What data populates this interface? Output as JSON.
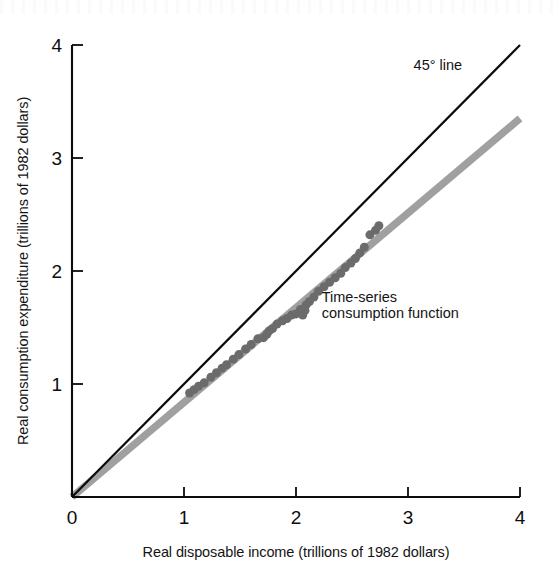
{
  "chart_data": {
    "type": "scatter",
    "title": "",
    "xlabel": "Real disposable income (trillions of 1982 dollars)",
    "ylabel": "Real consumption expenditure (trillions of 1982 dollars)",
    "xlim": [
      0,
      4
    ],
    "ylim": [
      0,
      4
    ],
    "xticks": [
      0,
      1,
      2,
      3,
      4
    ],
    "yticks": [
      0,
      1,
      2,
      3,
      4
    ],
    "xtick_labels": [
      "0",
      "1",
      "2",
      "3",
      "4"
    ],
    "ytick_labels": [
      "0",
      "1",
      "2",
      "3",
      "4"
    ],
    "grid": false,
    "legend": "none",
    "annotations": [
      {
        "text": "45° line",
        "x": 3.05,
        "y": 3.78
      },
      {
        "text": "Time-series",
        "x": 2.23,
        "y": 1.73
      },
      {
        "text": "consumption function",
        "x": 2.23,
        "y": 1.58
      }
    ],
    "series": [
      {
        "name": "45° line",
        "type": "line",
        "color": "#0b0b0b",
        "width": 2.2,
        "points": [
          [
            0,
            0
          ],
          [
            4,
            4
          ]
        ]
      },
      {
        "name": "Time-series consumption function",
        "type": "line",
        "color": "#a0a0a0",
        "width": 7.5,
        "slope": 0.838,
        "intercept": 0,
        "points": [
          [
            0,
            0
          ],
          [
            4,
            3.35
          ]
        ]
      },
      {
        "name": "Observations",
        "type": "scatter",
        "color": "#6b6b6b",
        "marker_size": 9,
        "x": [
          1.05,
          1.09,
          1.13,
          1.18,
          1.24,
          1.29,
          1.34,
          1.38,
          1.44,
          1.49,
          1.55,
          1.6,
          1.66,
          1.71,
          1.74,
          1.76,
          1.79,
          1.83,
          1.88,
          1.92,
          1.96,
          2.0,
          2.04,
          2.06,
          2.08,
          2.09,
          2.12,
          2.16,
          2.2,
          2.25,
          2.3,
          2.35,
          2.4,
          2.44,
          2.49,
          2.53,
          2.57,
          2.61,
          2.66,
          2.71,
          2.74
        ],
        "y": [
          0.92,
          0.95,
          0.98,
          1.01,
          1.06,
          1.1,
          1.14,
          1.17,
          1.22,
          1.26,
          1.31,
          1.35,
          1.4,
          1.41,
          1.44,
          1.47,
          1.49,
          1.53,
          1.56,
          1.58,
          1.61,
          1.62,
          1.66,
          1.61,
          1.65,
          1.7,
          1.73,
          1.77,
          1.82,
          1.86,
          1.9,
          1.94,
          1.98,
          2.03,
          2.07,
          2.11,
          2.16,
          2.21,
          2.32,
          2.36,
          2.4
        ]
      }
    ]
  },
  "colors": {
    "line_45": "#0b0b0b",
    "consumption_line": "#a0a0a0",
    "scatter": "#6b6b6b",
    "axis": "#0b0b0b",
    "text": "#141414",
    "background": "#ffffff"
  }
}
